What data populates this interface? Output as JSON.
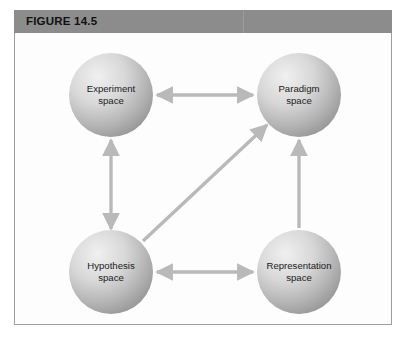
{
  "figure": {
    "header_label": "FIGURE 14.5",
    "header_bg": "#8c8c8c",
    "frame_border": "#9d9d9d",
    "frame_bg": "#fdfdfd"
  },
  "diagram": {
    "type": "node-link-diagram",
    "node_fill_light": "#ececec",
    "node_fill_dark": "#979797",
    "arrow_color": "#b9b9b9",
    "nodes": [
      {
        "id": "experiment",
        "line1": "Experiment",
        "line2": "space",
        "cx": 96,
        "cy": 62,
        "r": 42
      },
      {
        "id": "paradigm",
        "line1": "Paradigm",
        "line2": "space",
        "cx": 284,
        "cy": 62,
        "r": 42
      },
      {
        "id": "hypothesis",
        "line1": "Hypothesis",
        "line2": "space",
        "cx": 96,
        "cy": 239,
        "r": 42
      },
      {
        "id": "representation",
        "line1": "Representation",
        "line2": "space",
        "cx": 284,
        "cy": 239,
        "r": 42
      }
    ],
    "edges": [
      {
        "id": "experiment-paradigm",
        "from": "experiment",
        "to": "paradigm",
        "direction": "bidirectional",
        "orientation": "horizontal"
      },
      {
        "id": "experiment-hypothesis",
        "from": "hypothesis",
        "to": "experiment",
        "direction": "bidirectional",
        "orientation": "vertical"
      },
      {
        "id": "hypothesis-representation",
        "from": "hypothesis",
        "to": "representation",
        "direction": "bidirectional",
        "orientation": "horizontal"
      },
      {
        "id": "representation-paradigm",
        "from": "representation",
        "to": "paradigm",
        "direction": "unidirectional",
        "orientation": "vertical"
      },
      {
        "id": "hypothesis-paradigm",
        "from": "hypothesis",
        "to": "paradigm",
        "direction": "unidirectional",
        "orientation": "diagonal"
      }
    ]
  }
}
